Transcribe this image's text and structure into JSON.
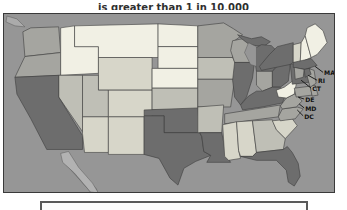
{
  "title": {
    "text": "is greater than 1 in 10,000"
  },
  "map": {
    "background_color": "#969696",
    "frame_border_color": "#3a3a3a",
    "state_border_color": "#3c3c3c",
    "palette": {
      "very_light": "#f1f0e4",
      "light": "#d7d6c9",
      "medium_light": "#bfbfb6",
      "medium": "#a5a5a0",
      "dark": "#6d6d6d",
      "baja_peninsula": "#b2b2b2",
      "gulf_water": "#8d8d8d",
      "canada_coast": "#ababab"
    },
    "states": {
      "WA": "medium",
      "OR": "medium",
      "CA": "dark",
      "ID": "very_light",
      "MT": "very_light",
      "NV": "medium_light",
      "UT": "medium_light",
      "AZ": "light",
      "NM": "light",
      "CO": "light",
      "WY": "light",
      "ND": "very_light",
      "SD": "very_light",
      "NE": "very_light",
      "KS": "medium_light",
      "OK": "dark",
      "TX": "dark",
      "MN": "medium",
      "IA": "medium_light",
      "MO": "medium",
      "AR": "medium_light",
      "LA": "dark",
      "WI": "medium",
      "IL": "dark",
      "MI": "dark",
      "IN": "medium",
      "OH": "dark",
      "KY": "dark",
      "TN": "medium",
      "MS": "light",
      "AL": "light",
      "GA": "medium_light",
      "FL": "dark",
      "SC": "light",
      "NC": "medium",
      "VA": "medium",
      "WV": "very_light",
      "PA": "dark",
      "NY": "dark",
      "NJ": "medium",
      "DE": "medium",
      "MD": "medium",
      "VT": "light",
      "NH": "very_light",
      "ME": "very_light",
      "MA": "dark",
      "RI": "dark",
      "CT": "medium"
    },
    "callouts": [
      "MA",
      "RI",
      "CT",
      "DE",
      "MD",
      "DC"
    ]
  }
}
